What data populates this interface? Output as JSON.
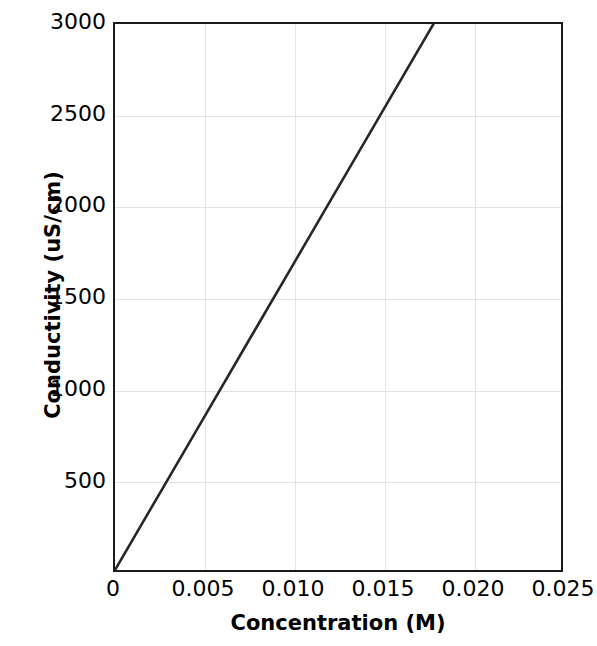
{
  "chart_data": {
    "type": "line",
    "title": "",
    "xlabel": "Concentration (M)",
    "ylabel": "Conductivity (uS/cm)",
    "xlim": [
      0,
      0.025
    ],
    "ylim": [
      0,
      3000
    ],
    "xticks": [
      "0",
      "0.005",
      "0.010",
      "0.015",
      "0.020",
      "0.025"
    ],
    "xtick_values": [
      0,
      0.005,
      0.01,
      0.015,
      0.02,
      0.025
    ],
    "yticks": [
      "500",
      "1000",
      "1500",
      "2000",
      "2500",
      "3000"
    ],
    "ytick_values": [
      500,
      1000,
      1500,
      2000,
      2500,
      3000
    ],
    "grid": true,
    "legend": "none",
    "series": [
      {
        "name": "Conductivity vs Concentration",
        "color": "#262626",
        "line_width": 2,
        "x": [
          0,
          0.0025,
          0.005,
          0.0075,
          0.01,
          0.0125,
          0.015,
          0.01785
        ],
        "values": [
          0,
          420,
          840,
          1261,
          1681,
          2101,
          2521,
          3000
        ]
      }
    ],
    "annotations": []
  },
  "axis_style": {
    "frame_color": "#1a1a1a",
    "grid_color": "#e3e3e3",
    "background": "#ffffff",
    "text_color": "#000000"
  }
}
